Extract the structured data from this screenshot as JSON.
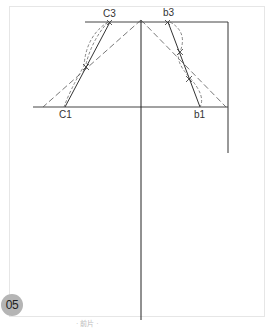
{
  "figure": {
    "badge": "05",
    "caption": "· 前片 ·",
    "labels": {
      "c3": "C3",
      "b3": "b3",
      "c1": "C1",
      "b1": "b1"
    },
    "colors": {
      "line": "#333333",
      "dashed": "#555555",
      "frame": "#e6e6e6",
      "badge": "#b5b5b5"
    }
  }
}
